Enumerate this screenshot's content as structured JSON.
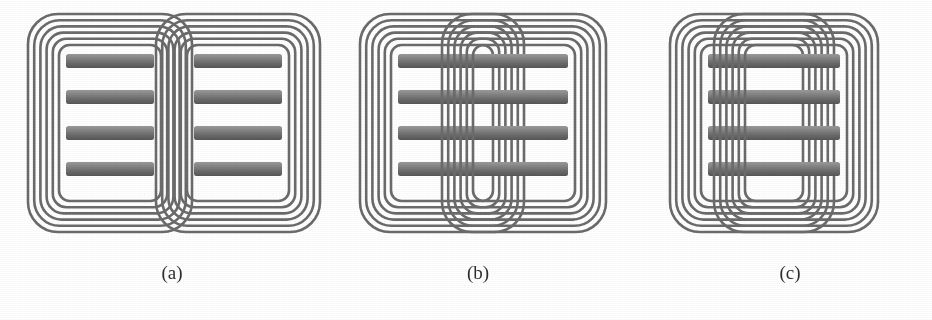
{
  "figure": {
    "kind": "technical-illustration",
    "background_color": "#ffffff",
    "trace_color": "#6b6b6b",
    "trace_color_dark": "#565656",
    "bar_color_light": "#8d8d8d",
    "bar_color_dark": "#5a5a5a",
    "caption_color": "#2f2f2f",
    "panel_count": 3
  },
  "panels": [
    {
      "id": "a",
      "caption": "(a)",
      "caption_center_x": 172,
      "arrangement": "side-by-side, minimally overlapping",
      "coil_count": 2,
      "turns_per_coil": 6,
      "bars_per_coil": 4,
      "horizontal_offset_px": 148,
      "overlap_px": 30,
      "coil_width_px": 168,
      "coil_height_px": 222
    },
    {
      "id": "b",
      "caption": "(b)",
      "caption_center_x": 478,
      "arrangement": "heavily overlapping, loops interleaved",
      "coil_count": 2,
      "turns_per_coil": 6,
      "bars_per_coil": 4,
      "horizontal_offset_px": 96,
      "overlap_px": 82,
      "coil_width_px": 168,
      "coil_height_px": 222
    },
    {
      "id": "c",
      "caption": "(c)",
      "caption_center_x": 790,
      "arrangement": "nearly concentric, small offset",
      "coil_count": 2,
      "turns_per_coil": 6,
      "bars_per_coil": 4,
      "horizontal_offset_px": 46,
      "overlap_px": 122,
      "coil_width_px": 168,
      "coil_height_px": 222
    }
  ],
  "coil_geometry": {
    "turn_stroke_px": 2.6,
    "turn_pitch_px": 6.2,
    "corner_radius_px": 30,
    "bar_height_px": 14,
    "bar_pitch_px": 36,
    "bar_inset_px": 20
  }
}
